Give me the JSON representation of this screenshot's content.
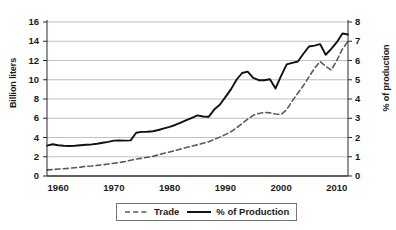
{
  "chart_data": {
    "type": "line",
    "title": "",
    "xlabel": "",
    "ylabel": "Billion liters",
    "ylabel_right": "% of production",
    "xlim": [
      1958,
      2012
    ],
    "ylim": [
      0,
      16
    ],
    "ylim_right": [
      0,
      8
    ],
    "grid": true,
    "legend_position": "bottom",
    "xticks": [
      1960,
      1970,
      1980,
      1990,
      2000,
      2010
    ],
    "xtick_labels": [
      "1960",
      "1970",
      "1980",
      "1990",
      "2000",
      "2010"
    ],
    "yticks_left": [
      0,
      2,
      4,
      6,
      8,
      10,
      12,
      14,
      16
    ],
    "ytick_labels_left": [
      "0",
      "2",
      "4",
      "6",
      "8",
      "10",
      "12",
      "14",
      "16"
    ],
    "yticks_right": [
      0,
      1,
      2,
      3,
      4,
      5,
      6,
      7,
      8
    ],
    "ytick_labels_right": [
      "0",
      "1",
      "2",
      "3",
      "4",
      "5",
      "6",
      "7",
      "8"
    ],
    "x": [
      1958,
      1959,
      1960,
      1961,
      1962,
      1963,
      1964,
      1965,
      1966,
      1967,
      1968,
      1969,
      1970,
      1971,
      1972,
      1973,
      1974,
      1975,
      1976,
      1977,
      1978,
      1979,
      1980,
      1981,
      1982,
      1983,
      1984,
      1985,
      1986,
      1987,
      1988,
      1989,
      1990,
      1991,
      1992,
      1993,
      1994,
      1995,
      1996,
      1997,
      1998,
      1999,
      2000,
      2001,
      2002,
      2003,
      2004,
      2005,
      2006,
      2007,
      2008,
      2009,
      2010,
      2011,
      2012
    ],
    "series": [
      {
        "name": "Trade",
        "axis": "right",
        "style": "dashed",
        "color": "#5a5a5a",
        "values_right_axis": [
          0.32,
          0.33,
          0.36,
          0.38,
          0.4,
          0.43,
          0.46,
          0.5,
          0.52,
          0.55,
          0.58,
          0.62,
          0.66,
          0.7,
          0.75,
          0.82,
          0.88,
          0.92,
          0.97,
          1.02,
          1.1,
          1.18,
          1.25,
          1.32,
          1.4,
          1.48,
          1.55,
          1.62,
          1.7,
          1.78,
          1.9,
          2.02,
          2.15,
          2.3,
          2.5,
          2.72,
          2.95,
          3.15,
          3.25,
          3.3,
          3.28,
          3.22,
          3.2,
          3.45,
          3.9,
          4.3,
          4.7,
          5.15,
          5.6,
          5.95,
          5.7,
          5.5,
          6.0,
          6.6,
          7.0
        ],
        "values_billion_liters_equivalent": [
          0.64,
          0.66,
          0.72,
          0.76,
          0.8,
          0.86,
          0.92,
          1.0,
          1.04,
          1.1,
          1.16,
          1.24,
          1.32,
          1.4,
          1.5,
          1.64,
          1.76,
          1.84,
          1.94,
          2.04,
          2.2,
          2.36,
          2.5,
          2.64,
          2.8,
          2.96,
          3.1,
          3.24,
          3.4,
          3.56,
          3.8,
          4.04,
          4.3,
          4.6,
          5.0,
          5.44,
          5.9,
          6.3,
          6.5,
          6.6,
          6.56,
          6.44,
          6.4,
          6.9,
          7.8,
          8.6,
          9.4,
          10.3,
          11.2,
          11.9,
          11.4,
          11.0,
          12.0,
          13.2,
          14.0
        ]
      },
      {
        "name": "% of Production",
        "axis": "left",
        "style": "solid",
        "color": "#111111",
        "values": [
          3.15,
          3.3,
          3.2,
          3.15,
          3.12,
          3.15,
          3.2,
          3.25,
          3.28,
          3.35,
          3.45,
          3.55,
          3.68,
          3.7,
          3.68,
          3.7,
          4.5,
          4.58,
          4.6,
          4.65,
          4.78,
          4.95,
          5.1,
          5.3,
          5.55,
          5.8,
          6.05,
          6.3,
          6.18,
          6.15,
          6.9,
          7.4,
          8.2,
          9.0,
          10.0,
          10.7,
          10.85,
          10.2,
          9.95,
          9.95,
          10.05,
          9.1,
          10.4,
          11.6,
          11.75,
          11.9,
          12.7,
          13.45,
          13.55,
          13.7,
          12.6,
          13.2,
          13.9,
          14.8,
          14.7
        ]
      }
    ]
  },
  "legend": {
    "items": [
      {
        "label": "Trade",
        "style": "dashed"
      },
      {
        "label": "% of Production",
        "style": "solid"
      }
    ]
  }
}
